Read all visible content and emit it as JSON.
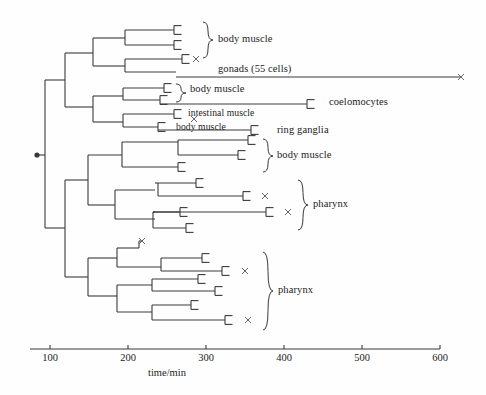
{
  "figure": {
    "kind": "cell-lineage-tree",
    "stroke_color": "#3a3a3a",
    "text_color": "#1b1b1b",
    "background": "#ffffff"
  },
  "axis": {
    "label": "time/min",
    "ticks": [
      100,
      200,
      300,
      400,
      500,
      600
    ],
    "tick_labels": [
      "100",
      "200",
      "300",
      "400",
      "500",
      "600"
    ],
    "px_per_100min": 78,
    "x_at_100": 50,
    "axis_y": 349,
    "axis_x_start": 30,
    "axis_x_end": 440
  },
  "root": {
    "dot_x": 37,
    "dot_y": 155,
    "stem_x": 45
  },
  "labels": [
    {
      "name": "body-muscle-1",
      "text": "body muscle",
      "x": 218,
      "y": 40,
      "size": "n"
    },
    {
      "name": "gonads",
      "text": "gonads (55 cells)",
      "x": 218,
      "y": 70,
      "size": "n"
    },
    {
      "name": "body-muscle-2",
      "text": "body  muscle",
      "x": 190,
      "y": 90,
      "size": "n"
    },
    {
      "name": "coelomocytes",
      "text": "coelomocytes",
      "x": 329,
      "y": 103,
      "size": "n"
    },
    {
      "name": "intestinal-muscle",
      "text": "intestinal  muscle",
      "x": 188,
      "y": 114,
      "size": "sm"
    },
    {
      "name": "body-muscle-3",
      "text": "body  muscle",
      "x": 176,
      "y": 128,
      "size": "sm"
    },
    {
      "name": "ring-ganglia",
      "text": "ring ganglia",
      "x": 277,
      "y": 131,
      "size": "n"
    },
    {
      "name": "body-muscle-4",
      "text": "body  muscle",
      "x": 277,
      "y": 156,
      "size": "n"
    },
    {
      "name": "pharynx-1",
      "text": "pharynx",
      "x": 313,
      "y": 205,
      "size": "n"
    },
    {
      "name": "pharynx-2",
      "text": "pharynx",
      "x": 278,
      "y": 291,
      "size": "n"
    }
  ],
  "braces": [
    {
      "name": "brace-body-muscle-1",
      "x": 208,
      "y_top": 22,
      "y_bottom": 58,
      "tip_y": 40
    },
    {
      "name": "brace-body-muscle-2",
      "x": 181,
      "y_top": 84,
      "y_bottom": 102,
      "tip_y": 93
    },
    {
      "name": "brace-body-muscle-4",
      "x": 268,
      "y_top": 139,
      "y_bottom": 172,
      "tip_y": 156
    },
    {
      "name": "brace-pharynx-1",
      "x": 303,
      "y_top": 180,
      "y_bottom": 230,
      "tip_y": 205
    },
    {
      "name": "brace-pharynx-2",
      "x": 268,
      "y_top": 252,
      "y_bottom": 330,
      "tip_y": 291
    }
  ],
  "hlines": [
    {
      "name": "h-root-upper",
      "x1": 45,
      "x2": 65,
      "y": 80
    },
    {
      "name": "h-root-lower",
      "x1": 45,
      "x2": 65,
      "y": 228
    },
    {
      "name": "h-u-a",
      "x1": 65,
      "x2": 93,
      "y": 53
    },
    {
      "name": "h-u-b",
      "x1": 65,
      "x2": 93,
      "y": 107
    },
    {
      "name": "h-ua-a",
      "x1": 93,
      "x2": 125,
      "y": 38
    },
    {
      "name": "h-ua-b",
      "x1": 93,
      "x2": 125,
      "y": 66
    },
    {
      "name": "h-uaa-1",
      "x1": 125,
      "x2": 174,
      "y": 30
    },
    {
      "name": "h-uaa-2",
      "x1": 125,
      "x2": 174,
      "y": 45
    },
    {
      "name": "h-uab-1",
      "x1": 125,
      "x2": 182,
      "y": 59
    },
    {
      "name": "h-uab-2",
      "x1": 125,
      "x2": 176,
      "y": 72
    },
    {
      "name": "h-gonads-long",
      "x1": 176,
      "x2": 461,
      "y": 77
    },
    {
      "name": "h-ub-a",
      "x1": 93,
      "x2": 123,
      "y": 96
    },
    {
      "name": "h-ub-b",
      "x1": 93,
      "x2": 123,
      "y": 122
    },
    {
      "name": "h-uba-1",
      "x1": 123,
      "x2": 164,
      "y": 88
    },
    {
      "name": "h-uba-2",
      "x1": 123,
      "x2": 160,
      "y": 100
    },
    {
      "name": "h-coelo-long",
      "x1": 160,
      "x2": 307,
      "y": 104
    },
    {
      "name": "h-ubb-1",
      "x1": 123,
      "x2": 174,
      "y": 114
    },
    {
      "name": "h-ubb-2",
      "x1": 123,
      "x2": 158,
      "y": 127
    },
    {
      "name": "h-ring-long",
      "x1": 158,
      "x2": 251,
      "y": 130
    },
    {
      "name": "h-l-a",
      "x1": 65,
      "x2": 88,
      "y": 180
    },
    {
      "name": "h-l-b",
      "x1": 65,
      "x2": 88,
      "y": 277
    },
    {
      "name": "h-la-a",
      "x1": 88,
      "x2": 122,
      "y": 155
    },
    {
      "name": "h-la-b",
      "x1": 88,
      "x2": 115,
      "y": 205
    },
    {
      "name": "h-laa-1",
      "x1": 122,
      "x2": 178,
      "y": 142
    },
    {
      "name": "h-laa-2",
      "x1": 122,
      "x2": 178,
      "y": 167
    },
    {
      "name": "h-laaa-1",
      "x1": 178,
      "x2": 248,
      "y": 140
    },
    {
      "name": "h-laaa-2",
      "x1": 178,
      "x2": 238,
      "y": 155
    },
    {
      "name": "h-lab-a",
      "x1": 115,
      "x2": 155,
      "y": 190
    },
    {
      "name": "h-lab-b",
      "x1": 115,
      "x2": 155,
      "y": 219
    },
    {
      "name": "h-laba-1",
      "x1": 155,
      "x2": 158,
      "y": 183
    },
    {
      "name": "h-laba-1b",
      "x1": 158,
      "x2": 196,
      "y": 183
    },
    {
      "name": "h-laba-2",
      "x1": 158,
      "x2": 243,
      "y": 196
    },
    {
      "name": "h-labb-1",
      "x1": 155,
      "x2": 153,
      "y": 212
    },
    {
      "name": "h-labb-1b",
      "x1": 153,
      "x2": 180,
      "y": 212
    },
    {
      "name": "h-labb-2",
      "x1": 153,
      "x2": 266,
      "y": 212
    },
    {
      "name": "h-labb-3",
      "x1": 153,
      "x2": 186,
      "y": 228
    },
    {
      "name": "h-lb-a",
      "x1": 88,
      "x2": 117,
      "y": 258
    },
    {
      "name": "h-lb-b",
      "x1": 88,
      "x2": 117,
      "y": 296
    },
    {
      "name": "h-lba-1",
      "x1": 117,
      "x2": 139,
      "y": 248
    },
    {
      "name": "h-lba-2",
      "x1": 117,
      "x2": 161,
      "y": 267
    },
    {
      "name": "h-lbaa-1",
      "x1": 161,
      "x2": 202,
      "y": 258
    },
    {
      "name": "h-lbaa-2",
      "x1": 161,
      "x2": 222,
      "y": 271
    },
    {
      "name": "h-lbb-a",
      "x1": 117,
      "x2": 152,
      "y": 285
    },
    {
      "name": "h-lbb-b",
      "x1": 117,
      "x2": 152,
      "y": 312
    },
    {
      "name": "h-lbba-1",
      "x1": 152,
      "x2": 198,
      "y": 279
    },
    {
      "name": "h-lbba-2",
      "x1": 152,
      "x2": 215,
      "y": 291
    },
    {
      "name": "h-lbbb-1",
      "x1": 152,
      "x2": 191,
      "y": 305
    },
    {
      "name": "h-lbbb-2",
      "x1": 152,
      "x2": 225,
      "y": 320
    }
  ],
  "vlines": [
    {
      "name": "v-root",
      "x": 45,
      "y1": 80,
      "y2": 228
    },
    {
      "name": "v-upper",
      "x": 65,
      "y1": 53,
      "y2": 107
    },
    {
      "name": "v-ua",
      "x": 93,
      "y1": 38,
      "y2": 66
    },
    {
      "name": "v-uaa",
      "x": 125,
      "y1": 30,
      "y2": 45
    },
    {
      "name": "v-uab",
      "x": 125,
      "y1": 59,
      "y2": 72
    },
    {
      "name": "v-ub",
      "x": 93,
      "y1": 96,
      "y2": 122
    },
    {
      "name": "v-uba",
      "x": 123,
      "y1": 88,
      "y2": 100
    },
    {
      "name": "v-ubb",
      "x": 123,
      "y1": 114,
      "y2": 127
    },
    {
      "name": "v-lower",
      "x": 65,
      "y1": 180,
      "y2": 277
    },
    {
      "name": "v-la",
      "x": 88,
      "y1": 155,
      "y2": 205
    },
    {
      "name": "v-laa",
      "x": 122,
      "y1": 142,
      "y2": 167
    },
    {
      "name": "v-laaa",
      "x": 178,
      "y1": 140,
      "y2": 155
    },
    {
      "name": "v-lab",
      "x": 115,
      "y1": 190,
      "y2": 219
    },
    {
      "name": "v-laba",
      "x": 158,
      "y1": 183,
      "y2": 196
    },
    {
      "name": "v-labb",
      "x": 153,
      "y1": 212,
      "y2": 228
    },
    {
      "name": "v-lb",
      "x": 88,
      "y1": 258,
      "y2": 296
    },
    {
      "name": "v-lba",
      "x": 117,
      "y1": 248,
      "y2": 267
    },
    {
      "name": "v-lbaa",
      "x": 161,
      "y1": 258,
      "y2": 271
    },
    {
      "name": "v-lbb",
      "x": 117,
      "y1": 285,
      "y2": 312
    },
    {
      "name": "v-lbba",
      "x": 152,
      "y1": 279,
      "y2": 291
    },
    {
      "name": "v-lbbb",
      "x": 152,
      "y1": 305,
      "y2": 320
    }
  ],
  "forks": [
    {
      "name": "fork-body-muscle-1a",
      "x": 174,
      "y": 30
    },
    {
      "name": "fork-body-muscle-1b",
      "x": 174,
      "y": 45
    },
    {
      "name": "fork-gonad-sib",
      "x": 182,
      "y": 59
    },
    {
      "name": "fork-body-muscle-2a",
      "x": 164,
      "y": 88
    },
    {
      "name": "fork-body-muscle-2b",
      "x": 160,
      "y": 100
    },
    {
      "name": "fork-coelomocytes",
      "x": 307,
      "y": 104
    },
    {
      "name": "fork-intestinal",
      "x": 174,
      "y": 114
    },
    {
      "name": "fork-body-muscle-3",
      "x": 158,
      "y": 127
    },
    {
      "name": "fork-ring-ganglia",
      "x": 251,
      "y": 130
    },
    {
      "name": "fork-bm4-a",
      "x": 248,
      "y": 140
    },
    {
      "name": "fork-bm4-b",
      "x": 238,
      "y": 155
    },
    {
      "name": "fork-bm4-c",
      "x": 178,
      "y": 167
    },
    {
      "name": "fork-ph1-a",
      "x": 196,
      "y": 183
    },
    {
      "name": "fork-ph1-b",
      "x": 243,
      "y": 196
    },
    {
      "name": "fork-ph1-c",
      "x": 180,
      "y": 212
    },
    {
      "name": "fork-ph1-d",
      "x": 266,
      "y": 212
    },
    {
      "name": "fork-ph1-e",
      "x": 186,
      "y": 228
    },
    {
      "name": "fork-ph2-a",
      "x": 202,
      "y": 258
    },
    {
      "name": "fork-ph2-b",
      "x": 222,
      "y": 271
    },
    {
      "name": "fork-ph2-c",
      "x": 198,
      "y": 279
    },
    {
      "name": "fork-ph2-d",
      "x": 215,
      "y": 291
    },
    {
      "name": "fork-ph2-e",
      "x": 191,
      "y": 305
    },
    {
      "name": "fork-ph2-f",
      "x": 225,
      "y": 320
    }
  ],
  "crosses": [
    {
      "name": "cross-gonad-sib",
      "x": 196,
      "y": 59
    },
    {
      "name": "cross-gonads-end",
      "x": 461,
      "y": 77
    },
    {
      "name": "cross-intestinal",
      "x": 194,
      "y": 119
    },
    {
      "name": "cross-ph1-b",
      "x": 265,
      "y": 196
    },
    {
      "name": "cross-ph1-d",
      "x": 288,
      "y": 212
    },
    {
      "name": "cross-ph2-top",
      "x": 142,
      "y": 241
    },
    {
      "name": "cross-ph2-b",
      "x": 245,
      "y": 271
    },
    {
      "name": "cross-ph2-f",
      "x": 248,
      "y": 320
    }
  ],
  "extra_stubs": [
    {
      "name": "stub-ph2-top",
      "x1": 139,
      "x2": 139,
      "y1": 248,
      "y2": 241
    },
    {
      "name": "stub-ph2-top-h",
      "x1": 139,
      "x2": 142,
      "y1": 241,
      "y2": 241
    }
  ]
}
